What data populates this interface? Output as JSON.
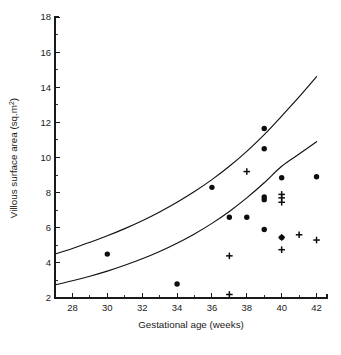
{
  "chart_data": {
    "type": "scatter",
    "title": "",
    "xlabel": "Gestational age (weeks)",
    "ylabel": "Villous surface area (sq.m²)",
    "xlim": [
      27,
      42.6
    ],
    "ylim": [
      2,
      18
    ],
    "grid": false,
    "legend": "none",
    "xticks": [
      28,
      30,
      32,
      34,
      36,
      38,
      40,
      42
    ],
    "xticks_minor": [
      27,
      29,
      31,
      33,
      35,
      37,
      39,
      41
    ],
    "yticks": [
      2,
      4,
      6,
      8,
      10,
      12,
      14,
      16,
      18
    ],
    "yticks_minor": [
      3,
      5,
      7,
      9,
      11,
      13,
      15,
      17
    ],
    "series": [
      {
        "name": "circle-markers",
        "marker": "filled-circle",
        "points": [
          [
            30.0,
            4.5
          ],
          [
            34.0,
            2.8
          ],
          [
            36.0,
            8.3
          ],
          [
            37.0,
            6.6
          ],
          [
            38.0,
            6.6
          ],
          [
            39.0,
            11.65
          ],
          [
            39.0,
            10.5
          ],
          [
            39.0,
            7.75
          ],
          [
            39.0,
            7.6
          ],
          [
            39.0,
            5.9
          ],
          [
            40.0,
            8.85
          ],
          [
            40.0,
            5.45
          ],
          [
            42.0,
            8.9
          ]
        ]
      },
      {
        "name": "plus-markers",
        "marker": "plus",
        "points": [
          [
            37.0,
            4.4
          ],
          [
            37.0,
            2.2
          ],
          [
            38.0,
            9.2
          ],
          [
            40.0,
            7.9
          ],
          [
            40.0,
            7.7
          ],
          [
            40.0,
            7.45
          ],
          [
            40.0,
            5.45
          ],
          [
            40.0,
            4.75
          ],
          [
            41.0,
            5.6
          ],
          [
            42.0,
            5.3
          ]
        ]
      }
    ],
    "curves": [
      {
        "name": "upper-reference-curve",
        "x": [
          27,
          28,
          29,
          30,
          31,
          32,
          33,
          34,
          35,
          36,
          37,
          38,
          39,
          40,
          41,
          42
        ],
        "y": [
          4.5,
          4.82,
          5.17,
          5.54,
          5.95,
          6.4,
          6.9,
          7.45,
          8.06,
          8.74,
          9.5,
          10.35,
          11.3,
          12.36,
          13.45,
          14.6
        ]
      },
      {
        "name": "lower-reference-curve",
        "x": [
          27,
          28,
          29,
          30,
          31,
          32,
          33,
          34,
          35,
          36,
          37,
          38,
          39,
          40,
          41,
          42
        ],
        "y": [
          2.75,
          2.98,
          3.24,
          3.53,
          3.86,
          4.23,
          4.65,
          5.12,
          5.65,
          6.25,
          6.93,
          7.7,
          8.56,
          9.5,
          10.2,
          10.9
        ]
      }
    ]
  },
  "caption": {
    "text": ""
  }
}
